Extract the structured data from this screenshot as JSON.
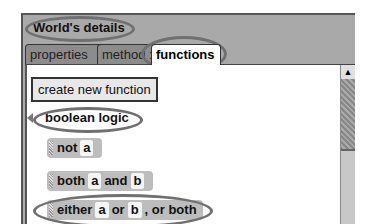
{
  "panel": {
    "title": "World's details",
    "tabs": [
      {
        "label": "properties",
        "active": false
      },
      {
        "label": "method :",
        "active": false
      },
      {
        "label": "functions",
        "active": true
      }
    ]
  },
  "content": {
    "create_button": "create new function",
    "group_label": "boolean logic",
    "tiles": [
      {
        "parts": [
          "not",
          "a"
        ]
      },
      {
        "parts": [
          "both",
          "a",
          "and",
          "b"
        ]
      },
      {
        "parts": [
          "either",
          "a",
          "or",
          "b",
          ", or both"
        ]
      }
    ],
    "scroll_up_glyph": "▲"
  },
  "colors": {
    "panel_bg": "#a9a9a9",
    "tile_bg": "#bdbdbd",
    "highlight_oval": "#707070"
  }
}
